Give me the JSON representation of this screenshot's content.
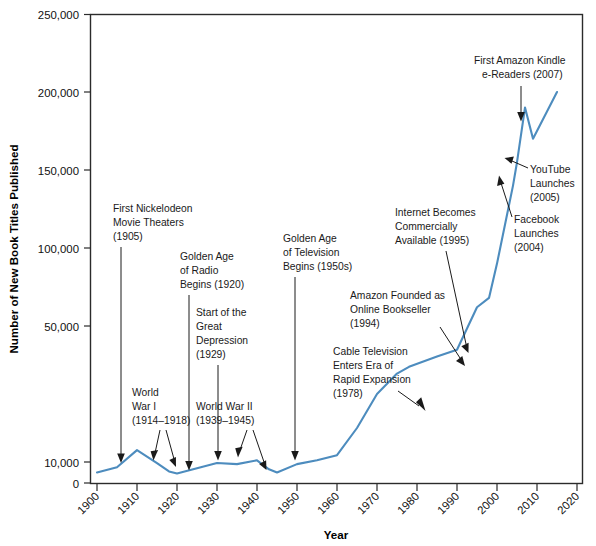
{
  "chart_data": {
    "type": "line",
    "title": "",
    "xlabel": "Year",
    "ylabel": "Number of New Book Titles Published",
    "xlim": [
      1900,
      2020
    ],
    "ylim": [
      0,
      250000
    ],
    "grid": false,
    "legend": "none",
    "line_color": "#4d8cbe",
    "y_axis_note": "Non-linear y axis: compressed between 0 and 50,000 with an extra tick at 10,000",
    "y_ticks": [
      "0",
      "10,000",
      "50,000",
      "100,000",
      "150,000",
      "200,000",
      "250,000"
    ],
    "y_tick_values": [
      0,
      10000,
      50000,
      100000,
      150000,
      200000,
      250000
    ],
    "x_ticks": [
      "1900",
      "1910",
      "1920",
      "1930",
      "1940",
      "1950",
      "1960",
      "1970",
      "1980",
      "1990",
      "2000",
      "2010",
      "2020"
    ],
    "x_tick_values": [
      1900,
      1910,
      1920,
      1930,
      1940,
      1950,
      1960,
      1970,
      1980,
      1990,
      2000,
      2010,
      2020
    ],
    "x": [
      1900,
      1905,
      1910,
      1915,
      1918,
      1920,
      1925,
      1930,
      1935,
      1940,
      1943,
      1945,
      1950,
      1955,
      1960,
      1965,
      1970,
      1975,
      1978,
      1985,
      1990,
      1995,
      1998,
      2000,
      2004,
      2005,
      2007,
      2009,
      2015
    ],
    "values": [
      5000,
      7500,
      13500,
      9500,
      5500,
      4500,
      7000,
      9500,
      9000,
      10500,
      6500,
      5000,
      9000,
      10500,
      12000,
      20000,
      30000,
      36000,
      38000,
      41000,
      43000,
      62000,
      68000,
      90000,
      140000,
      155000,
      190000,
      170000,
      200000
    ],
    "series": [
      {
        "name": "New Book Titles Published",
        "values": [
          5000,
          7500,
          13500,
          9500,
          5500,
          4500,
          7000,
          9500,
          9000,
          10500,
          6500,
          5000,
          9000,
          10500,
          12000,
          20000,
          30000,
          36000,
          38000,
          41000,
          43000,
          62000,
          68000,
          90000,
          140000,
          155000,
          190000,
          170000,
          200000
        ]
      }
    ],
    "annotations": [
      {
        "id": "nickelodeon",
        "lines": [
          "First Nickelodeon",
          "Movie Theaters",
          "(1905)"
        ],
        "year": 1905
      },
      {
        "id": "radio",
        "lines": [
          "Golden Age",
          "of Radio",
          "Begins (1920)"
        ],
        "year": 1920
      },
      {
        "id": "great-depression",
        "lines": [
          "Start of the",
          "Great",
          "Depression",
          "(1929)"
        ],
        "year": 1929
      },
      {
        "id": "world-war-i",
        "lines": [
          "World",
          "War I",
          "(1914–1918)"
        ],
        "year": 1914
      },
      {
        "id": "world-war-ii",
        "lines": [
          "World War II",
          "(1939–1945)"
        ],
        "year": 1939
      },
      {
        "id": "television",
        "lines": [
          "Golden Age",
          "of Television",
          "Begins (1950s)"
        ],
        "year": 1950
      },
      {
        "id": "cable-television",
        "lines": [
          "Cable Television",
          "Enters Era of",
          "Rapid Expansion",
          "(1978)"
        ],
        "year": 1978
      },
      {
        "id": "amazon-founded",
        "lines": [
          "Amazon Founded as",
          "Online Bookseller",
          "(1994)"
        ],
        "year": 1994
      },
      {
        "id": "internet-commercial",
        "lines": [
          "Internet Becomes",
          "Commercially",
          "Available (1995)"
        ],
        "year": 1995
      },
      {
        "id": "facebook",
        "lines": [
          "Facebook",
          "Launches",
          "(2004)"
        ],
        "year": 2004
      },
      {
        "id": "youtube",
        "lines": [
          "YouTube",
          "Launches",
          "(2005)"
        ],
        "year": 2005
      },
      {
        "id": "kindle",
        "lines": [
          "First Amazon Kindle",
          "e-Readers (2007)"
        ],
        "year": 2007
      }
    ]
  },
  "axes": {
    "y_title": "Number of New Book Titles Published",
    "x_title": "Year",
    "y_labels": [
      "250,000",
      "200,000",
      "150,000",
      "100,000",
      "50,000",
      "10,000",
      "0"
    ],
    "x_labels": [
      "1900",
      "1910",
      "1920",
      "1930",
      "1940",
      "1950",
      "1960",
      "1970",
      "1980",
      "1990",
      "2000",
      "2010",
      "2020"
    ]
  },
  "annotation_text": {
    "nickelodeon_l1": "First Nickelodeon",
    "nickelodeon_l2": "Movie Theaters",
    "nickelodeon_l3": "(1905)",
    "radio_l1": "Golden Age",
    "radio_l2": "of Radio",
    "radio_l3": "Begins (1920)",
    "depression_l1": "Start of the",
    "depression_l2": "Great",
    "depression_l3": "Depression",
    "depression_l4": "(1929)",
    "ww1_l1": "World",
    "ww1_l2": "War I",
    "ww1_l3": "(1914–1918)",
    "ww2_l1": "World War II",
    "ww2_l2": "(1939–1945)",
    "tv_l1": "Golden Age",
    "tv_l2": "of Television",
    "tv_l3": "Begins (1950s)",
    "cable_l1": "Cable Television",
    "cable_l2": "Enters Era of",
    "cable_l3": "Rapid Expansion",
    "cable_l4": "(1978)",
    "amazon_l1": "Amazon Founded as",
    "amazon_l2": "Online Bookseller",
    "amazon_l3": "(1994)",
    "internet_l1": "Internet Becomes",
    "internet_l2": "Commercially",
    "internet_l3": "Available (1995)",
    "facebook_l1": "Facebook",
    "facebook_l2": "Launches",
    "facebook_l3": "(2004)",
    "youtube_l1": "YouTube",
    "youtube_l2": "Launches",
    "youtube_l3": "(2005)",
    "kindle_l1": "First Amazon Kindle",
    "kindle_l2": "e-Readers (2007)"
  }
}
